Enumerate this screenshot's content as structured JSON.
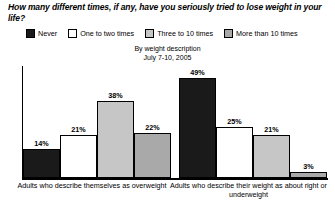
{
  "chart_data": {
    "type": "bar",
    "title": "How many different times, if any, have you seriously tried to lose weight in your life?",
    "subtitle_line1": "By weight description",
    "subtitle_line2": "July 7-10, 2005",
    "xlabel": "",
    "ylabel": "",
    "ylim": [
      0,
      55
    ],
    "grid": false,
    "legend_position": "top",
    "value_suffix": "%",
    "categories": [
      "Adults who describe themselves as overweight",
      "Adults who describe their weight as about right or underweight"
    ],
    "series": [
      {
        "name": "Never",
        "color": "#1a1a1a",
        "values": [
          14,
          49
        ],
        "labels": [
          "14%",
          "49%"
        ]
      },
      {
        "name": "One to two times",
        "color": "#ffffff",
        "values": [
          21,
          25
        ],
        "labels": [
          "21%",
          "25%"
        ]
      },
      {
        "name": "Three to 10 times",
        "color": "#c6c6c6",
        "values": [
          38,
          21
        ],
        "labels": [
          "38%",
          "21%"
        ]
      },
      {
        "name": "More than 10 times",
        "color": "#a9a9a9",
        "values": [
          22,
          3
        ],
        "labels": [
          "22%",
          "3%"
        ]
      }
    ]
  }
}
